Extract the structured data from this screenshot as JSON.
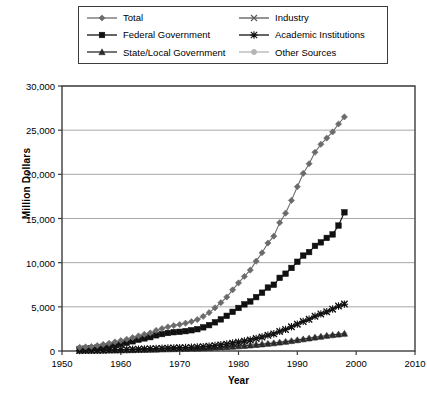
{
  "chart_data": {
    "type": "line",
    "title": "",
    "xlabel": "Year",
    "ylabel": "Million Dollars",
    "xlim": [
      1950,
      2010
    ],
    "ylim": [
      0,
      30000
    ],
    "xticks": [
      1950,
      1960,
      1970,
      1980,
      1990,
      2000,
      2010
    ],
    "xtick_labels": [
      "1950",
      "1960",
      "1970",
      "1980",
      "1990",
      "2000",
      "2010"
    ],
    "yticks": [
      0,
      5000,
      10000,
      15000,
      20000,
      25000,
      30000
    ],
    "ytick_labels": [
      "0",
      "5,000",
      "10,000",
      "15,000",
      "20,000",
      "25,000",
      "30,000"
    ],
    "grid": "horizontal",
    "legend_position": "top",
    "legend_columns": 2,
    "x": [
      1953,
      1954,
      1955,
      1956,
      1957,
      1958,
      1959,
      1960,
      1961,
      1962,
      1963,
      1964,
      1965,
      1966,
      1967,
      1968,
      1969,
      1970,
      1971,
      1972,
      1973,
      1974,
      1975,
      1976,
      1977,
      1978,
      1979,
      1980,
      1981,
      1982,
      1983,
      1984,
      1985,
      1986,
      1987,
      1988,
      1989,
      1990,
      1991,
      1992,
      1993,
      1994,
      1995,
      1996,
      1997,
      1998
    ],
    "series": [
      {
        "name": "Total",
        "marker": "diamond",
        "color": "#6b6b6b",
        "line_color": "#6b6b6b",
        "values": [
          420,
          460,
          510,
          620,
          740,
          870,
          1030,
          1180,
          1330,
          1520,
          1710,
          1890,
          2050,
          2330,
          2540,
          2730,
          2880,
          3000,
          3150,
          3330,
          3560,
          3920,
          4340,
          4890,
          5470,
          6110,
          6920,
          7710,
          8440,
          9160,
          10170,
          11120,
          12220,
          13000,
          14530,
          15600,
          17050,
          18600,
          20100,
          21200,
          22500,
          23400,
          24100,
          24800,
          25700,
          26500
        ]
      },
      {
        "name": "Federal Government",
        "marker": "square",
        "color": "#111111",
        "line_color": "#111111",
        "values": [
          230,
          260,
          300,
          380,
          480,
          580,
          700,
          800,
          930,
          1100,
          1280,
          1430,
          1570,
          1780,
          1920,
          2040,
          2130,
          2170,
          2250,
          2350,
          2470,
          2680,
          2930,
          3250,
          3580,
          3980,
          4430,
          4870,
          5280,
          5610,
          6100,
          6600,
          7180,
          7500,
          8280,
          8750,
          9400,
          10100,
          10800,
          11200,
          11900,
          12300,
          12800,
          13200,
          14200,
          15700
        ]
      },
      {
        "name": "State/Local Government",
        "marker": "triangle",
        "color": "#2a2a2a",
        "line_color": "#2a2a2a",
        "values": [
          40,
          45,
          50,
          58,
          66,
          75,
          85,
          95,
          105,
          118,
          130,
          145,
          160,
          178,
          195,
          210,
          225,
          240,
          255,
          270,
          290,
          315,
          345,
          380,
          415,
          455,
          500,
          550,
          600,
          650,
          710,
          770,
          840,
          900,
          980,
          1060,
          1150,
          1250,
          1350,
          1450,
          1550,
          1650,
          1750,
          1830,
          1900,
          1980
        ]
      },
      {
        "name": "Industry",
        "marker": "cross",
        "color": "#5a5a5a",
        "line_color": "#5a5a5a",
        "values": [
          55,
          62,
          70,
          82,
          95,
          110,
          125,
          140,
          155,
          175,
          195,
          215,
          235,
          260,
          285,
          305,
          325,
          340,
          360,
          385,
          415,
          460,
          515,
          585,
          660,
          745,
          850,
          960,
          1080,
          1200,
          1370,
          1540,
          1740,
          1900,
          2180,
          2400,
          2700,
          3000,
          3300,
          3550,
          3900,
          4150,
          4400,
          4700,
          5050,
          5350
        ]
      },
      {
        "name": "Academic Institutions",
        "marker": "star",
        "color": "#111111",
        "line_color": "#111111",
        "values": [
          60,
          68,
          77,
          90,
          104,
          120,
          137,
          153,
          170,
          192,
          214,
          236,
          258,
          286,
          312,
          336,
          358,
          375,
          398,
          425,
          455,
          500,
          555,
          625,
          705,
          795,
          900,
          1010,
          1130,
          1250,
          1420,
          1590,
          1790,
          1950,
          2230,
          2450,
          2750,
          3050,
          3350,
          3600,
          3950,
          4200,
          4450,
          4750,
          5100,
          5300
        ]
      },
      {
        "name": "Other Sources",
        "marker": "circle",
        "color": "#b4b4b4",
        "line_color": "#b4b4b4",
        "values": [
          35,
          40,
          45,
          52,
          60,
          68,
          78,
          88,
          98,
          110,
          122,
          136,
          150,
          167,
          183,
          198,
          212,
          226,
          240,
          255,
          274,
          298,
          327,
          360,
          394,
          432,
          476,
          523,
          570,
          618,
          675,
          732,
          798,
          855,
          932,
          1010,
          1095,
          1190,
          1285,
          1380,
          1475,
          1570,
          1665,
          1740,
          1810,
          1880
        ]
      }
    ]
  },
  "legend": {
    "entries": [
      {
        "label": "Total"
      },
      {
        "label": "Industry"
      },
      {
        "label": "Federal Government"
      },
      {
        "label": "Academic Institutions"
      },
      {
        "label": "State/Local Government"
      },
      {
        "label": "Other Sources"
      }
    ]
  },
  "axes": {
    "frame_color": "#3c3c3c",
    "grid_color": "#a8a8a8"
  }
}
